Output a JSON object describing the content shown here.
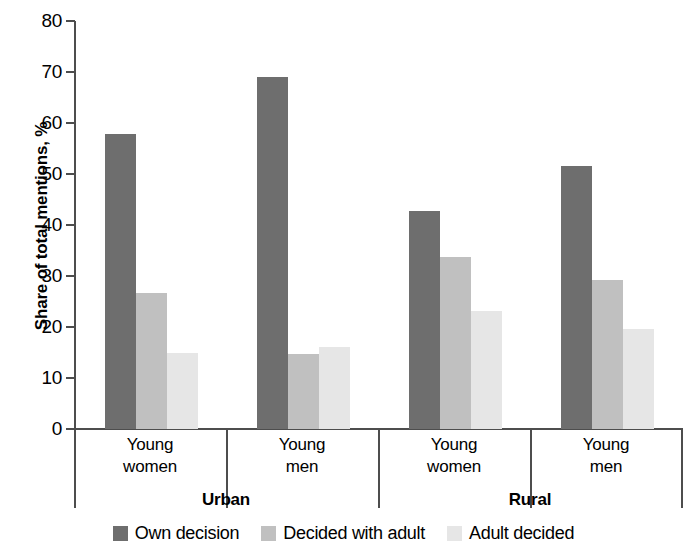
{
  "chart_data": {
    "type": "bar",
    "title": "",
    "xlabel": "",
    "ylabel": "Share of total mentions, %",
    "ylim": [
      0,
      80
    ],
    "ytick_step": 10,
    "yticks": [
      80,
      70,
      60,
      50,
      40,
      30,
      20,
      10,
      0
    ],
    "grid": false,
    "legend_position": "bottom",
    "categories": [
      "Young women",
      "Young men",
      "Young women",
      "Young men"
    ],
    "category_lines": [
      [
        "Young",
        "women"
      ],
      [
        "Young",
        "men"
      ],
      [
        "Young",
        "women"
      ],
      [
        "Young",
        "men"
      ]
    ],
    "supergroups": [
      {
        "label": "Urban",
        "categories": [
          "Young women",
          "Young men"
        ]
      },
      {
        "label": "Rural",
        "categories": [
          "Young women",
          "Young men"
        ]
      }
    ],
    "series": [
      {
        "name": "Own decision",
        "color": "#6e6e6e",
        "values": [
          57.8,
          69.1,
          42.8,
          51.5
        ]
      },
      {
        "name": "Decided with adult",
        "color": "#c0c0c0",
        "values": [
          26.6,
          14.8,
          33.8,
          29.3
        ]
      },
      {
        "name": "Adult decided",
        "color": "#e6e6e6",
        "values": [
          15.0,
          16.1,
          23.2,
          19.6
        ]
      }
    ]
  },
  "axis": {
    "line_color": "#4d4d4d"
  }
}
